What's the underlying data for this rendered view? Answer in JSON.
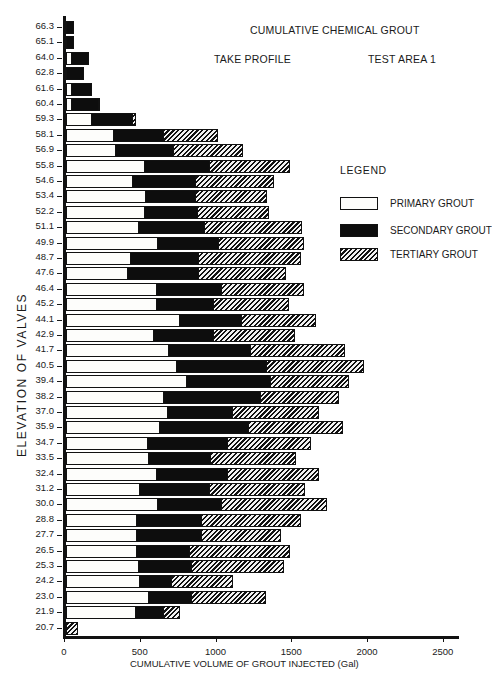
{
  "chart_data": {
    "type": "bar",
    "orientation": "horizontal",
    "stacked": true,
    "title": "CUMULATIVE CHEMICAL GROUT",
    "subtitle_left": "TAKE PROFILE",
    "subtitle_right": "TEST AREA 1",
    "xlabel": "CUMULATIVE VOLUME OF GROUT INJECTED  (Gal)",
    "ylabel": "ELEVATION OF VALVES",
    "xlim": [
      0,
      2600
    ],
    "xticks": [
      "0",
      "500",
      "1000",
      "1500",
      "2000",
      "2500"
    ],
    "grid": false,
    "legend_title": "LEGEND",
    "legend_position": "right",
    "categories": [
      "66.3",
      "65.1",
      "64.0",
      "62.8",
      "61.6",
      "60.4",
      "59.3",
      "58.1",
      "56.9",
      "55.8",
      "54.6",
      "53.4",
      "52.2",
      "51.1",
      "49.9",
      "48.7",
      "47.6",
      "46.4",
      "45.2",
      "44.1",
      "42.9",
      "41.7",
      "40.5",
      "39.4",
      "38.2",
      "37.0",
      "35.9",
      "34.7",
      "33.5",
      "32.4",
      "31.2",
      "30.0",
      "28.8",
      "27.7",
      "26.5",
      "25.3",
      "24.2",
      "23.0",
      "21.9",
      "20.7"
    ],
    "cumulative_series": [
      {
        "name": "PRIMARY GROUT",
        "fill": "white",
        "values": [
          0,
          0,
          40,
          0,
          40,
          40,
          170,
          320,
          330,
          520,
          440,
          530,
          520,
          480,
          610,
          430,
          410,
          600,
          600,
          750,
          580,
          680,
          730,
          800,
          650,
          670,
          620,
          540,
          550,
          600,
          490,
          610,
          470,
          470,
          470,
          480,
          490,
          550,
          460,
          0
        ]
      },
      {
        "name": "SECONDARY GROUT",
        "fill": "black",
        "values": [
          50,
          50,
          150,
          120,
          170,
          220,
          440,
          650,
          710,
          950,
          860,
          860,
          870,
          920,
          1010,
          880,
          880,
          1030,
          980,
          1160,
          980,
          1220,
          1330,
          1350,
          1290,
          1100,
          1210,
          1070,
          960,
          1070,
          950,
          1030,
          900,
          900,
          820,
          830,
          700,
          830,
          650,
          0
        ]
      },
      {
        "name": "TERTIARY GROUT",
        "fill": "hatched",
        "values": [
          50,
          50,
          150,
          120,
          170,
          225,
          460,
          1000,
          1170,
          1480,
          1370,
          1330,
          1340,
          1560,
          1570,
          1550,
          1450,
          1570,
          1470,
          1650,
          1510,
          1840,
          1970,
          1870,
          1800,
          1670,
          1830,
          1620,
          1520,
          1670,
          1580,
          1720,
          1550,
          1420,
          1480,
          1440,
          1100,
          1320,
          750,
          80
        ]
      }
    ]
  },
  "legend": {
    "title": "LEGEND",
    "items": [
      {
        "label": "PRIMARY GROUT",
        "fill": "primary"
      },
      {
        "label": "SECONDARY GROUT",
        "fill": "secondary"
      },
      {
        "label": "TERTIARY GROUT",
        "fill": "tertiary"
      }
    ]
  }
}
